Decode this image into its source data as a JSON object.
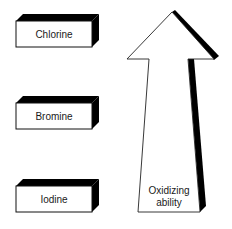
{
  "diagram": {
    "title": "",
    "halogens": [
      {
        "label": "Chlorine"
      },
      {
        "label": "Bromine"
      },
      {
        "label": "Iodine"
      }
    ],
    "arrow": {
      "label_line1": "Oxidizing",
      "label_line2": "ability",
      "direction": "up"
    },
    "colors": {
      "background": "#ffffff",
      "outline": "#111111",
      "shadow": "#000000",
      "fill": "#ffffff"
    }
  }
}
